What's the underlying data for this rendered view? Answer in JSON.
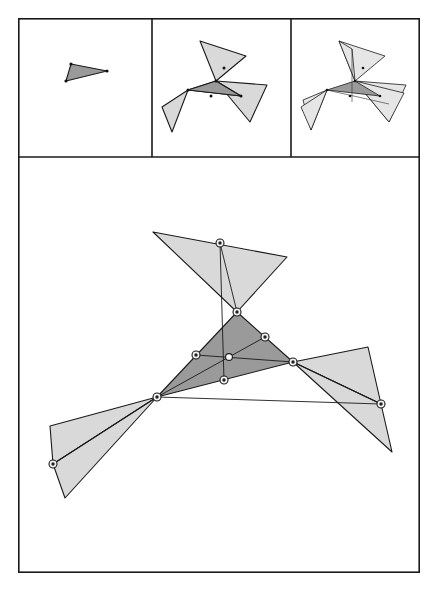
{
  "figure": {
    "background_color": "#ffffff",
    "stroke_color": "#1a1a1a",
    "panel_count": 4,
    "dark_fill": "#9a9a9a",
    "light_fill": "#d9d9d9",
    "lighter_fill": "#e6e6e6",
    "node_fill": "#222222",
    "node_ring_fill": "#f2f2f2",
    "center_node_fill": "#ffffff"
  },
  "frame": {
    "outer": {
      "x": 18,
      "y": 18,
      "width": 402,
      "height": 555
    },
    "divider_vertical_1_x": 152,
    "divider_vertical_2_x": 291,
    "divider_horizontal_y": 157
  },
  "panels": [
    {
      "name": "step-1-seed-triangle",
      "index": 1,
      "label": "seed triangle",
      "x": 18,
      "y": 18,
      "width": 134,
      "height": 139,
      "shapes": [
        {
          "name": "seed-triangle",
          "fill": "#9a9a9a",
          "points": "71,64 107,71 66,81"
        }
      ],
      "markers": [
        {
          "x": 71,
          "y": 64
        },
        {
          "x": 107,
          "y": 71
        },
        {
          "x": 66,
          "y": 81
        }
      ]
    },
    {
      "name": "step-2-first-reflections",
      "index": 2,
      "label": "first reflection set",
      "x": 152,
      "y": 18,
      "width": 139,
      "height": 139,
      "shapes": [
        {
          "name": "core-triangle",
          "fill": "#9a9a9a",
          "points": "202,73 231,90 202,57"
        },
        {
          "name": "reflected-top",
          "fill": "#d9d9d9",
          "points": "200,41 245,55 202,73"
        },
        {
          "name": "reflected-left",
          "fill": "#d9d9d9",
          "points": "202,73 172,108 158,128"
        },
        {
          "name": "reflected-right",
          "fill": "#d9d9d9",
          "points": "231,90 265,84 247,118"
        }
      ],
      "markers": [
        {
          "x": 202,
          "y": 73
        },
        {
          "x": 231,
          "y": 90
        },
        {
          "x": 202,
          "y": 57
        },
        {
          "x": 216,
          "y": 81
        },
        {
          "x": 217,
          "y": 65
        },
        {
          "x": 188,
          "y": 90
        }
      ]
    },
    {
      "name": "step-3-second-reflections",
      "index": 3,
      "label": "second reflection set",
      "x": 291,
      "y": 18,
      "width": 129,
      "height": 139,
      "shapes": [
        {
          "name": "core-triangle",
          "fill": "#9a9a9a",
          "points": "340,73 368,90 340,57"
        },
        {
          "name": "reflected-top",
          "fill": "#e6e6e6",
          "points": "338,41 383,55 340,73"
        },
        {
          "name": "reflected-left",
          "fill": "#e6e6e6",
          "points": "340,73 310,108 296,128"
        },
        {
          "name": "reflected-right",
          "fill": "#e6e6e6",
          "points": "368,90 402,84 385,118"
        },
        {
          "name": "reflected-extra-left",
          "fill": "#e6e6e6",
          "points": "340,73 305,96 300,122"
        },
        {
          "name": "reflected-extra-right",
          "fill": "#e6e6e6",
          "points": "368,90 400,95 378,112"
        }
      ],
      "markers": [
        {
          "x": 340,
          "y": 73
        },
        {
          "x": 368,
          "y": 90
        },
        {
          "x": 340,
          "y": 57
        },
        {
          "x": 354,
          "y": 81
        },
        {
          "x": 355,
          "y": 65
        },
        {
          "x": 326,
          "y": 90
        }
      ]
    },
    {
      "name": "main-detail-view",
      "index": 4,
      "label": "enlarged construction",
      "x": 18,
      "y": 157,
      "width": 402,
      "height": 416,
      "shapes": [
        {
          "name": "reflected-top-triangle",
          "fill": "#d9d9d9",
          "points": "153,232 287,257 237,312"
        },
        {
          "name": "reflected-left-triangle-upper",
          "fill": "#d9d9d9",
          "points": "157,397 50,426 53,464"
        },
        {
          "name": "reflected-left-triangle-lower",
          "fill": "#d9d9d9",
          "points": "157,397 53,464 65,498"
        },
        {
          "name": "reflected-right-triangle-upper",
          "fill": "#d9d9d9",
          "points": "293,362 368,347 381,404"
        },
        {
          "name": "reflected-right-triangle-lower",
          "fill": "#d9d9d9",
          "points": "293,362 381,404 392,452"
        },
        {
          "name": "central-triangle",
          "fill": "#9a9a9a",
          "points": "157,397 237,312 293,362"
        }
      ],
      "central_triangle": {
        "vertex_top": {
          "x": 237,
          "y": 312
        },
        "vertex_left": {
          "x": 157,
          "y": 397
        },
        "vertex_right": {
          "x": 293,
          "y": 362
        },
        "midpoint_left_top": {
          "x": 196,
          "y": 355
        },
        "midpoint_top_right": {
          "x": 265,
          "y": 337
        },
        "midpoint_left_right": {
          "x": 224,
          "y": 380
        },
        "centroid": {
          "x": 229,
          "y": 357
        }
      },
      "markers": [
        {
          "name": "node-top-apex",
          "x": 220,
          "y": 243
        },
        {
          "name": "node-central-top",
          "x": 237,
          "y": 312
        },
        {
          "name": "node-midpoint-top-right",
          "x": 265,
          "y": 337
        },
        {
          "name": "node-midpoint-left-top",
          "x": 196,
          "y": 355
        },
        {
          "name": "node-central-right",
          "x": 293,
          "y": 362
        },
        {
          "name": "node-midpoint-left-right",
          "x": 224,
          "y": 380
        },
        {
          "name": "node-central-left",
          "x": 157,
          "y": 397
        },
        {
          "name": "node-right-outer",
          "x": 381,
          "y": 404
        },
        {
          "name": "node-left-outer",
          "x": 53,
          "y": 464
        }
      ],
      "center_marker": {
        "name": "node-centroid",
        "x": 229,
        "y": 357
      }
    }
  ]
}
